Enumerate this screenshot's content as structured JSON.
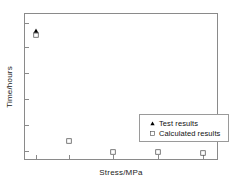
{
  "chart_data": {
    "type": "scatter",
    "title": "",
    "xlabel": "Stress/MPa",
    "ylabel": "Time/hours",
    "xlim": [
      0,
      1
    ],
    "ylim": [
      0,
      1
    ],
    "grid": false,
    "legend_position": "center-right",
    "xticks": [
      0.055,
      0.225,
      0.455,
      0.685,
      0.915
    ],
    "xticklabels": [
      "",
      "",
      "",
      "",
      ""
    ],
    "yticks": [
      0.07,
      0.245,
      0.42,
      0.6,
      0.775,
      0.94
    ],
    "yticklabels": [
      "",
      "",
      "",
      "",
      "",
      ""
    ],
    "series": [
      {
        "name": "Test results",
        "marker": "filled-triangle",
        "color": "#000000",
        "points": [
          {
            "x": 0.055,
            "y": 0.885
          }
        ]
      },
      {
        "name": "Calculated results",
        "marker": "open-square",
        "color": "#555555",
        "points": [
          {
            "x": 0.055,
            "y": 0.855
          },
          {
            "x": 0.225,
            "y": 0.135
          },
          {
            "x": 0.455,
            "y": 0.063
          },
          {
            "x": 0.685,
            "y": 0.058
          },
          {
            "x": 0.915,
            "y": 0.055
          }
        ]
      }
    ],
    "legend": [
      {
        "label": "Test results",
        "marker": "filled-triangle"
      },
      {
        "label": "Calculated results",
        "marker": "open-square"
      }
    ]
  },
  "figure": {
    "background": "#ffffff",
    "frame_color": "#8a8a8a",
    "text_color": "#1a1a1a"
  }
}
